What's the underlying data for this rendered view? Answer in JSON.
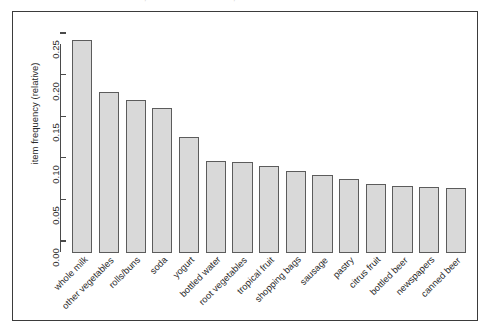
{
  "chart_data": {
    "type": "bar",
    "title": "",
    "xlabel": "",
    "ylabel": "item frequency (relative)",
    "ylim": [
      0,
      0.25
    ],
    "yticks": [
      "0.00",
      "0.05",
      "0.10",
      "0.15",
      "0.20",
      "0.25"
    ],
    "ytick_values": [
      0.0,
      0.05,
      0.1,
      0.15,
      0.2,
      0.25
    ],
    "grid": false,
    "legend": "none",
    "categories": [
      "whole milk",
      "other vegetables",
      "rolls/buns",
      "soda",
      "yogurt",
      "bottled water",
      "root vegetables",
      "tropical fruit",
      "shopping bags",
      "sausage",
      "pastry",
      "citrus fruit",
      "bottled beer",
      "newspapers",
      "canned beer"
    ],
    "values": [
      0.2555,
      0.1935,
      0.1839,
      0.1743,
      0.1395,
      0.1105,
      0.109,
      0.105,
      0.0985,
      0.0939,
      0.0889,
      0.0828,
      0.0805,
      0.0798,
      0.0777
    ],
    "bar_fill_color": "#d9d9d9",
    "bar_edge_color": "#5c5c5c",
    "axis_color": "#4a4a4a",
    "frame_color": "#3b3b3b",
    "background_color": "#ffffff"
  }
}
